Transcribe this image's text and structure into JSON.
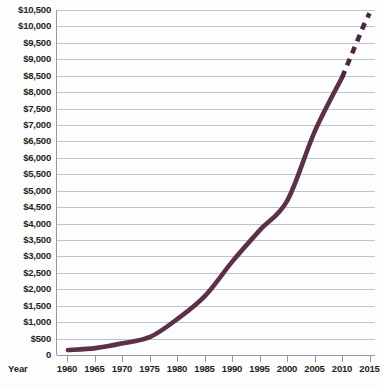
{
  "chart_data": {
    "type": "line",
    "title": "",
    "xlabel": "Year",
    "ylabel": "",
    "grid": true,
    "legend": null,
    "xlim": [
      1958,
      2016
    ],
    "ylim": [
      0,
      10500
    ],
    "x_tick_labels": [
      "1960",
      "1965",
      "1970",
      "1975",
      "1980",
      "1985",
      "1990",
      "1995",
      "2000",
      "2005",
      "2010",
      "2015"
    ],
    "x_ticks": [
      1960,
      1965,
      1970,
      1975,
      1980,
      1985,
      1990,
      1995,
      2000,
      2005,
      2010,
      2015
    ],
    "y_tick_labels": [
      "$10,500",
      "$10,000",
      "$9,500",
      "$9,000",
      "$8,500",
      "$8,000",
      "$7,500",
      "$7,000",
      "$6,500",
      "$6,000",
      "$5,500",
      "$5,000",
      "$4,500",
      "$4,000",
      "$3,500",
      "$3,000",
      "$2,500",
      "$2,000",
      "$1,500",
      "$1,000",
      "$500",
      "0"
    ],
    "y_ticks": [
      10500,
      10000,
      9500,
      9000,
      8500,
      8000,
      7500,
      7000,
      6500,
      6000,
      5500,
      5000,
      4500,
      4000,
      3500,
      3000,
      2500,
      2000,
      1500,
      1000,
      500,
      0
    ],
    "series": [
      {
        "name": "Actual",
        "style": "solid",
        "color": "#5b3048",
        "x": [
          1960,
          1965,
          1970,
          1975,
          1980,
          1985,
          1990,
          1995,
          2000,
          2005,
          2010
        ],
        "values": [
          150,
          210,
          355,
          550,
          1100,
          1800,
          2850,
          3800,
          4700,
          6800,
          8450
        ]
      },
      {
        "name": "Projected",
        "style": "dashed",
        "color": "#4a2740",
        "x": [
          2010,
          2011,
          2012,
          2013,
          2014,
          2015
        ],
        "values": [
          8450,
          8850,
          9250,
          9650,
          10050,
          10400
        ]
      }
    ],
    "colors": {
      "line": "#5b3048",
      "gridline": "#b9c4d0",
      "axis": "#8d9aa8",
      "text": "#231f20",
      "background": "#fdfdfd"
    }
  }
}
